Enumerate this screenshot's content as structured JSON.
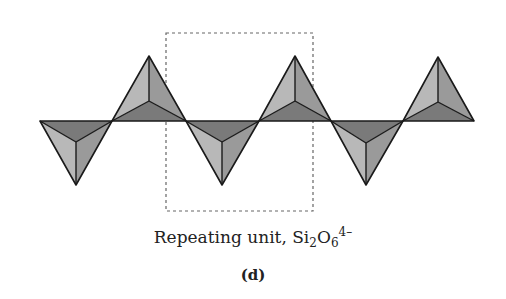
{
  "diagram": {
    "colors": {
      "light_face": "#b8b8b8",
      "mid_face": "#9a9a9a",
      "dark_face": "#7a7a7a",
      "edge": "#1a1a1a",
      "dashed_box": "#666666"
    },
    "baseline_y": 121,
    "tetrahedra": [
      {
        "orientation": "down",
        "left": 40,
        "right": 112,
        "apex": [
          76,
          185
        ],
        "center": [
          76,
          142
        ]
      },
      {
        "orientation": "up",
        "left": 112,
        "right": 186,
        "apex": [
          149,
          56
        ],
        "center": [
          149,
          101
        ]
      },
      {
        "orientation": "down",
        "left": 186,
        "right": 259,
        "apex": [
          222,
          185
        ],
        "center": [
          222,
          142
        ]
      },
      {
        "orientation": "up",
        "left": 259,
        "right": 331,
        "apex": [
          295,
          56
        ],
        "center": [
          295,
          101
        ]
      },
      {
        "orientation": "down",
        "left": 331,
        "right": 403,
        "apex": [
          366,
          185
        ],
        "center": [
          366,
          143
        ]
      },
      {
        "orientation": "up",
        "left": 403,
        "right": 474,
        "apex": [
          438,
          57
        ],
        "center": [
          438,
          102
        ]
      }
    ],
    "repeat_box": {
      "x": 166,
      "y": 33,
      "width": 147,
      "height": 178
    }
  },
  "caption": {
    "text": "Repeating unit, Si",
    "sub1": "2",
    "mid": "O",
    "sub2": "6",
    "charge": "4–"
  },
  "panel_label": "(d)"
}
